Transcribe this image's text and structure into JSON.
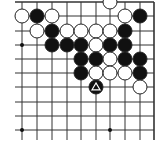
{
  "diagram": {
    "type": "go-board-fragment",
    "board_edges_visible": [
      "top",
      "right"
    ],
    "grid": {
      "columns_x": [
        22,
        37,
        52,
        67,
        81,
        96,
        110,
        125,
        140,
        154
      ],
      "rows_y": [
        2,
        16,
        31,
        45,
        59,
        73,
        87,
        102,
        116,
        130
      ],
      "line_color": "#333333",
      "background": "#ffffff"
    },
    "star_points": [
      {
        "col": 0,
        "row": 3
      },
      {
        "col": 0,
        "row": 9
      },
      {
        "col": 6,
        "row": 9
      }
    ],
    "stones": [
      {
        "col": 6,
        "row": 0,
        "color": "white"
      },
      {
        "col": 0,
        "row": 1,
        "color": "white"
      },
      {
        "col": 1,
        "row": 1,
        "color": "black"
      },
      {
        "col": 2,
        "row": 1,
        "color": "white"
      },
      {
        "col": 7,
        "row": 1,
        "color": "white"
      },
      {
        "col": 8,
        "row": 1,
        "color": "black"
      },
      {
        "col": 1,
        "row": 2,
        "color": "white"
      },
      {
        "col": 2,
        "row": 2,
        "color": "black"
      },
      {
        "col": 3,
        "row": 2,
        "color": "white"
      },
      {
        "col": 4,
        "row": 2,
        "color": "white"
      },
      {
        "col": 5,
        "row": 2,
        "color": "white"
      },
      {
        "col": 6,
        "row": 2,
        "color": "white"
      },
      {
        "col": 7,
        "row": 2,
        "color": "black"
      },
      {
        "col": 2,
        "row": 3,
        "color": "black"
      },
      {
        "col": 3,
        "row": 3,
        "color": "black"
      },
      {
        "col": 4,
        "row": 3,
        "color": "black"
      },
      {
        "col": 5,
        "row": 3,
        "color": "white"
      },
      {
        "col": 6,
        "row": 3,
        "color": "black"
      },
      {
        "col": 7,
        "row": 3,
        "color": "black"
      },
      {
        "col": 4,
        "row": 4,
        "color": "black"
      },
      {
        "col": 5,
        "row": 4,
        "color": "black"
      },
      {
        "col": 6,
        "row": 4,
        "color": "white"
      },
      {
        "col": 7,
        "row": 4,
        "color": "black"
      },
      {
        "col": 8,
        "row": 4,
        "color": "black"
      },
      {
        "col": 4,
        "row": 5,
        "color": "black"
      },
      {
        "col": 5,
        "row": 5,
        "color": "white"
      },
      {
        "col": 6,
        "row": 5,
        "color": "white"
      },
      {
        "col": 7,
        "row": 5,
        "color": "white"
      },
      {
        "col": 8,
        "row": 5,
        "color": "black"
      },
      {
        "col": 5,
        "row": 6,
        "color": "black",
        "marker": "triangle"
      },
      {
        "col": 8,
        "row": 6,
        "color": "white"
      }
    ],
    "colors": {
      "black_stone": "#111111",
      "white_stone": "#ffffff",
      "stone_outline": "#222222",
      "marker": "#ffffff"
    }
  }
}
